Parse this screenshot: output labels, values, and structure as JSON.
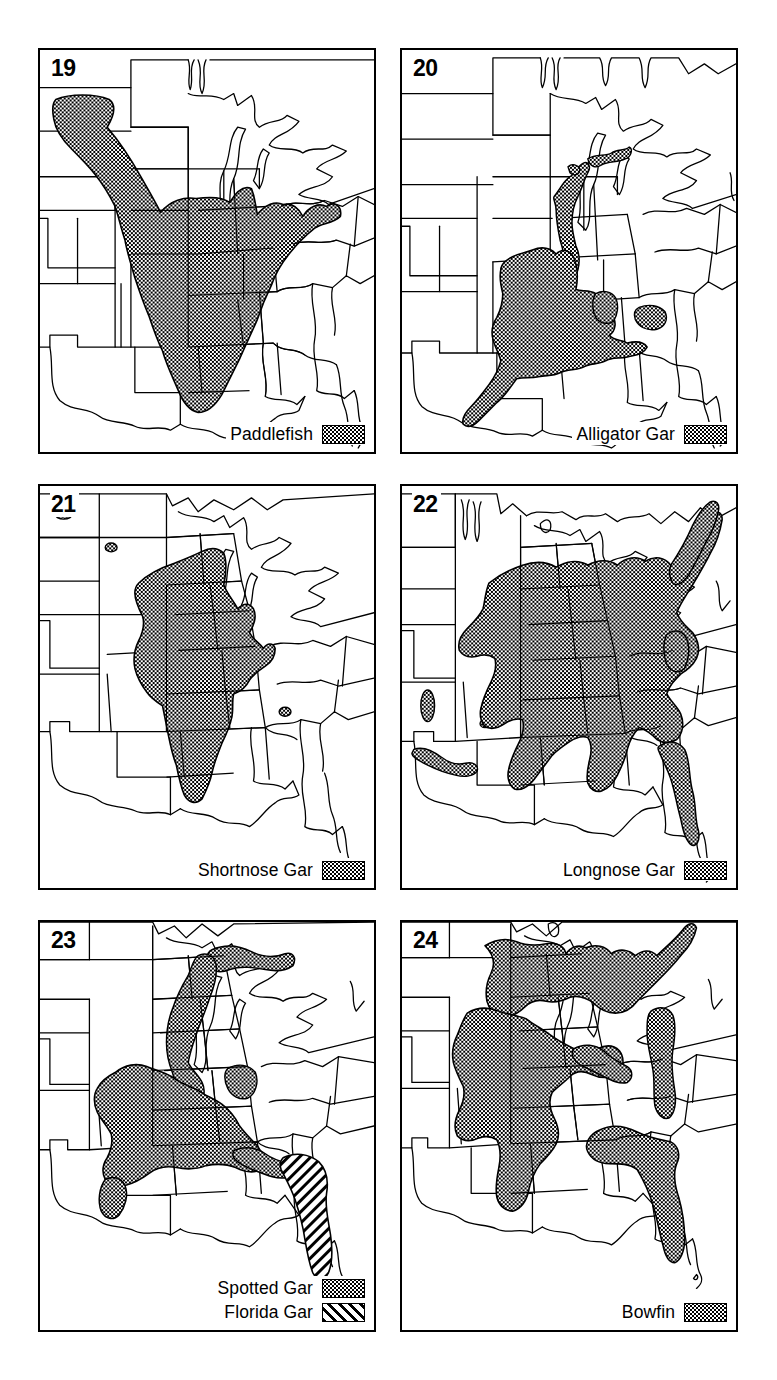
{
  "figure": {
    "kind": "species-distribution-map-plate",
    "region": "Eastern and central United States",
    "background_color": "#ffffff",
    "line_color": "#000000",
    "panel_count": 6
  },
  "panels": [
    {
      "number": "19",
      "legend": [
        {
          "label": "Paddlefish",
          "pattern": "dots",
          "swatch_name": "dotted-fill-swatch"
        }
      ],
      "range_summary": "Mississippi River basin from Montana across the Missouri River, south through the lower Mississippi valley to the Gulf Coast, east to the Ohio valley and Lake Erie"
    },
    {
      "number": "20",
      "legend": [
        {
          "label": "Alligator Gar",
          "pattern": "dots",
          "swatch_name": "dotted-fill-swatch"
        }
      ],
      "range_summary": "Lower Mississippi valley, Gulf Coast from Texas to western Florida panhandle, up the Mississippi to the Ohio River confluence"
    },
    {
      "number": "21",
      "legend": [
        {
          "label": "Shortnose Gar",
          "pattern": "dots",
          "swatch_name": "dotted-fill-swatch"
        }
      ],
      "range_summary": "Central Mississippi and Missouri River basins, Illinois, Iowa, Missouri, Arkansas, Louisiana, with Ohio valley extension"
    },
    {
      "number": "22",
      "legend": [
        {
          "label": "Longnose Gar",
          "pattern": "dots",
          "swatch_name": "dotted-fill-swatch"
        }
      ],
      "range_summary": "Widest range: Great Lakes and St. Lawrence south through the Mississippi basin to the Gulf Coast and the entire Atlantic slope to Florida, plus Rio Grande"
    },
    {
      "number": "23",
      "legend": [
        {
          "label": "Spotted Gar",
          "pattern": "dots",
          "swatch_name": "dotted-fill-swatch"
        },
        {
          "label": "Florida Gar",
          "pattern": "diagonal-hatch",
          "swatch_name": "hatched-fill-swatch"
        }
      ],
      "range_summary": "Spotted Gar in the lower Mississippi valley, Gulf Coast and Lake Erie drainage; Florida Gar restricted to peninsular Florida and southern Georgia"
    },
    {
      "number": "24",
      "legend": [
        {
          "label": "Bowfin",
          "pattern": "dots",
          "swatch_name": "dotted-fill-swatch"
        }
      ],
      "range_summary": "Great Lakes and Mississippi basin south to the Gulf Coast, Florida and north along the Atlantic coastal plain"
    }
  ]
}
